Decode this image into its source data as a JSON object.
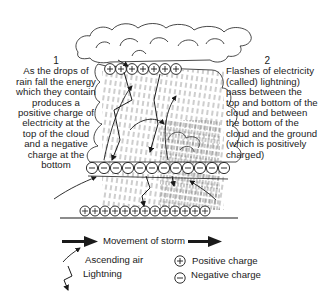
{
  "diagram": {
    "caption_1": {
      "number": "1",
      "text": "As the drops of rain fall the energy which they contain produces a positive charge of electricity at the top of the cloud and a negative charge at the bottom"
    },
    "caption_2": {
      "number": "2",
      "text": "Flashes of electricity (called) lightning) pass between the top and bottom of the cloud and between the bottom of the cloud and the ground (which is positively charged)"
    },
    "charges": {
      "cloud_top": {
        "sign": "+",
        "count": 7
      },
      "cloud_bottom": {
        "sign": "−",
        "count": 12
      },
      "ground": {
        "sign": "+",
        "count": 13
      }
    }
  },
  "legend": {
    "movement_of_storm": "Movement of storm",
    "ascending_air": "Ascending air",
    "lightning": "Lightning",
    "positive_charge": "Positive charge",
    "negative_charge": "Negative charge",
    "positive_symbol": "+",
    "negative_symbol": "−"
  },
  "colors": {
    "ink": "#1a1a1a",
    "background": "#ffffff"
  }
}
